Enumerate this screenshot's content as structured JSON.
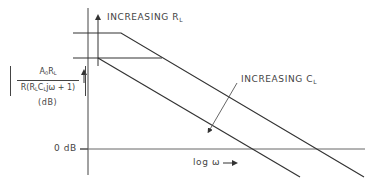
{
  "diagram": {
    "y_axis_label": {
      "numerator": "A",
      "numerator_sub": "0",
      "numerator_rest": "R",
      "numerator_rest_sub": "L",
      "denominator_pre": "R(R",
      "denominator_sub1": "L",
      "denominator_mid": "C",
      "denominator_sub2": "L",
      "denominator_post": "jω + 1)",
      "units": "(dB)"
    },
    "zero_db_label": "0 dB",
    "x_axis_label": "log ω",
    "annotations": {
      "increasing_rl": {
        "text": "INCREASING R",
        "sub": "L"
      },
      "increasing_cl": {
        "text": "INCREASING C",
        "sub": "L"
      }
    },
    "colors": {
      "line": "#333333",
      "axis": "#555555"
    }
  }
}
